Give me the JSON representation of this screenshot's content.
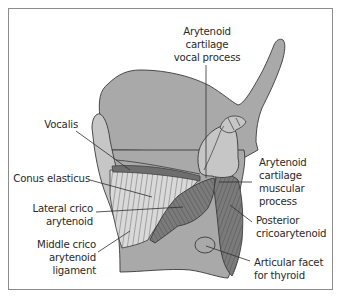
{
  "figure": {
    "colors": {
      "frame": "#8c8c8c",
      "cartilage": "#a9a9a9",
      "light_structure": "#c6c6c6",
      "muscle": "#7b7b7b",
      "muscle_stripe": "#5e5e5e",
      "outline": "#3a3a3a",
      "leader": "#2e2e2e",
      "text": "#2a2a2a"
    }
  },
  "labels": {
    "arytenoid_vocal_process": "Arytenoid\ncartilage\nvocal process",
    "vocalis": "Vocalis",
    "conus_elasticus": "Conus elasticus",
    "lateral_cricoarytenoid": "Lateral crico\narytenoid",
    "middle_cricoarytenoid_ligament": "Middle crico\narytenoid\nligament",
    "arytenoid_muscular_process": "Arytenoid\ncartilage\nmuscular\nprocess",
    "posterior_cricoarytenoid": "Posterior\ncricoarytenoid",
    "articular_facet_thyroid": "Articular facet\nfor thyroid"
  }
}
